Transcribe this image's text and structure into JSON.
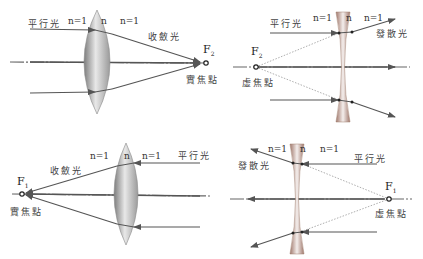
{
  "colors": {
    "ray": "#555555",
    "lens_dark": "#8a8a8a",
    "lens_light": "#f2f2f2",
    "concave_tint": "#b07a6a",
    "dashed": "#999999"
  },
  "panels": [
    {
      "id": "convex-right",
      "lens": "convex",
      "labels": {
        "incoming": "平行光",
        "n_left": "n=1",
        "n_lens": "n",
        "n_right": "n=1",
        "outgoing": "收斂光",
        "focus": "F",
        "focus_sub": "2",
        "focus_type": "實焦點"
      }
    },
    {
      "id": "concave-right",
      "lens": "concave",
      "labels": {
        "incoming": "平行光",
        "n_left": "n=1",
        "n_lens": "n",
        "n_right": "n=1",
        "outgoing": "發散光",
        "focus": "F",
        "focus_sub": "2",
        "focus_type": "虛焦點"
      }
    },
    {
      "id": "convex-left",
      "lens": "convex",
      "labels": {
        "incoming": "平行光",
        "n_left": "n=1",
        "n_lens": "n",
        "n_right": "n=1",
        "outgoing": "收斂光",
        "focus": "F",
        "focus_sub": "1",
        "focus_type": "實焦點"
      }
    },
    {
      "id": "concave-left",
      "lens": "concave",
      "labels": {
        "incoming": "平行光",
        "n_left": "n=1",
        "n_lens": "n",
        "n_right": "n=1",
        "outgoing": "發散光",
        "focus": "F",
        "focus_sub": "1",
        "focus_type": "虛焦點"
      }
    }
  ]
}
